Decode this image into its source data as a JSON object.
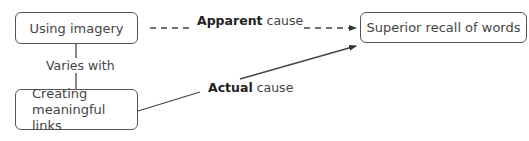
{
  "diagram": {
    "nodes": {
      "imagery": {
        "label": "Using imagery"
      },
      "recall": {
        "label": "Superior recall of words"
      },
      "links": {
        "line1": "Creating",
        "line2": "meaningful links"
      }
    },
    "edges": {
      "varies": {
        "label": "Varies with",
        "style": "solid",
        "arrow": false
      },
      "apparent": {
        "bold": "Apparent",
        "rest": " cause",
        "style": "dashed",
        "arrow": true
      },
      "actual": {
        "bold": "Actual",
        "rest": " cause",
        "style": "solid",
        "arrow": true
      }
    },
    "colors": {
      "line": "#444444",
      "border": "#555555",
      "text": "#444444"
    }
  }
}
